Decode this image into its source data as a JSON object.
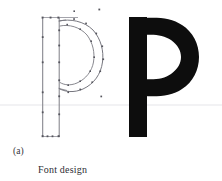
{
  "figure": {
    "panel_label": "(a)",
    "caption": "Font design",
    "glyph_character": "p",
    "colors": {
      "background": "#ffffff",
      "solid_glyph": "#0d0d0d",
      "outline_stroke": "#6f6f77",
      "bounding_box": "#8a8a92",
      "control_point": "#55555d",
      "baseline_guide": "#e2e2e6",
      "caption_text": "#2e2e34"
    },
    "outline_panel": {
      "name": "wireframe-glyph-p",
      "description": "outline glyph p with bezier control points",
      "bounding_box": {
        "x": 42,
        "y": 17,
        "width": 36,
        "height": 120
      },
      "baseline_y": 105,
      "x_height_top_y": 22,
      "descender_bottom_y": 137,
      "stem": {
        "left_x": 42,
        "right_x": 59,
        "top_y": 17,
        "bottom_y": 137
      },
      "outer_bowl_path": "M59,21 C76,19 94,26 100,43 C106,60 101,78 88,86 C76,93 65,91 59,87",
      "inner_bowl_path": "M62,27 C74,25 88,32 92,45 C96,58 92,71 82,78 C73,84 66,82 62,79",
      "control_points": [
        {
          "x": 43,
          "y": 18,
          "type": "corner"
        },
        {
          "x": 50,
          "y": 18,
          "type": "on-curve"
        },
        {
          "x": 58,
          "y": 18,
          "type": "corner"
        },
        {
          "x": 43,
          "y": 37,
          "type": "on-curve"
        },
        {
          "x": 59,
          "y": 30,
          "type": "on-curve"
        },
        {
          "x": 59,
          "y": 45,
          "type": "on-curve"
        },
        {
          "x": 43,
          "y": 62,
          "type": "on-curve"
        },
        {
          "x": 59,
          "y": 62,
          "type": "on-curve"
        },
        {
          "x": 59,
          "y": 80,
          "type": "on-curve"
        },
        {
          "x": 43,
          "y": 92,
          "type": "on-curve"
        },
        {
          "x": 59,
          "y": 96,
          "type": "on-curve"
        },
        {
          "x": 43,
          "y": 112,
          "type": "on-curve"
        },
        {
          "x": 59,
          "y": 114,
          "type": "on-curve"
        },
        {
          "x": 43,
          "y": 136,
          "type": "corner"
        },
        {
          "x": 51,
          "y": 136,
          "type": "on-curve"
        },
        {
          "x": 59,
          "y": 136,
          "type": "corner"
        },
        {
          "x": 75,
          "y": 19,
          "type": "off-curve"
        },
        {
          "x": 92,
          "y": 27,
          "type": "on-curve"
        },
        {
          "x": 100,
          "y": 40,
          "type": "on-curve"
        },
        {
          "x": 103,
          "y": 55,
          "type": "on-curve"
        },
        {
          "x": 99,
          "y": 70,
          "type": "on-curve"
        },
        {
          "x": 88,
          "y": 84,
          "type": "on-curve"
        },
        {
          "x": 74,
          "y": 90,
          "type": "on-curve"
        },
        {
          "x": 67,
          "y": 25,
          "type": "off-curve"
        },
        {
          "x": 82,
          "y": 31,
          "type": "off-curve"
        },
        {
          "x": 92,
          "y": 46,
          "type": "off-curve"
        },
        {
          "x": 91,
          "y": 62,
          "type": "off-curve"
        },
        {
          "x": 82,
          "y": 76,
          "type": "off-curve"
        },
        {
          "x": 70,
          "y": 82,
          "type": "off-curve"
        },
        {
          "x": 74,
          "y": 11,
          "type": "stray"
        },
        {
          "x": 99,
          "y": 9,
          "type": "stray"
        },
        {
          "x": 101,
          "y": 96,
          "type": "stray"
        }
      ]
    },
    "rendered_panel": {
      "name": "solid-glyph-p",
      "description": "solid black rendered glyph p",
      "stem": {
        "x": 129,
        "y": 17,
        "width": 18,
        "height": 120
      },
      "bowl_outer": {
        "cx": 163,
        "cy": 55,
        "rx": 32,
        "ry": 38
      },
      "bowl_counter": {
        "cx": 160,
        "cy": 55,
        "rx": 16,
        "ry": 23
      }
    }
  }
}
